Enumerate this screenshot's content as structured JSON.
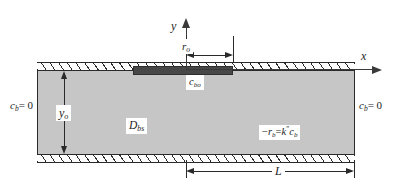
{
  "figure": {
    "colors": {
      "domain_fill": "#c6c6c6",
      "source_strip": "#474747",
      "line": "#2a2a2a",
      "background": "#ffffff"
    }
  },
  "axes": {
    "y_label": "y",
    "x_label": "x",
    "origin_note": "origin at center of top wall"
  },
  "dimensions": {
    "r_o": {
      "symbol": "r",
      "subscript": "o",
      "desc": "half-width of source strip"
    },
    "y_o": {
      "symbol": "y",
      "subscript": "o",
      "desc": "depth of domain"
    },
    "L": {
      "symbol": "L",
      "subscript": "",
      "desc": "length from centerline to right boundary"
    }
  },
  "labels": {
    "source_concentration": {
      "symbol": "c",
      "subscript": "bo"
    },
    "diffusivity": {
      "symbol": "D",
      "subscript": "bs"
    },
    "reaction_rate": {
      "minus": "−",
      "r": "r",
      "r_sub": "b",
      "equals": "=",
      "k": "k",
      "k_sup": "″",
      "c": "c",
      "c_sub": "b"
    },
    "bc_left": {
      "symbol": "c",
      "subscript": "b",
      "equation": "= 0"
    },
    "bc_right": {
      "symbol": "c",
      "subscript": "b",
      "equation": "= 0"
    }
  }
}
